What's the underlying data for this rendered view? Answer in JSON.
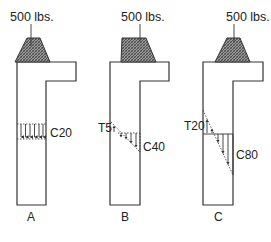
{
  "figure": {
    "type": "structural stress diagram",
    "panels": [
      {
        "id": "A",
        "label": "A",
        "load_label": "500 lbs.",
        "stress_labels": [
          "C20"
        ],
        "stress_type": "uniform compression",
        "compression": "C20"
      },
      {
        "id": "B",
        "label": "B",
        "load_label": "500 lbs.",
        "stress_labels": [
          "T5",
          "C40"
        ],
        "stress_type": "linear: small tension, compression",
        "tension": "T5",
        "compression": "C40"
      },
      {
        "id": "C",
        "label": "C",
        "load_label": "500 lbs.",
        "stress_labels": [
          "T20",
          "C80"
        ],
        "stress_type": "linear: tension, larger compression",
        "tension": "T20",
        "compression": "C80"
      }
    ]
  },
  "colors": {
    "line": "#333333",
    "hatch": "#555555",
    "background": "#ffffff"
  }
}
